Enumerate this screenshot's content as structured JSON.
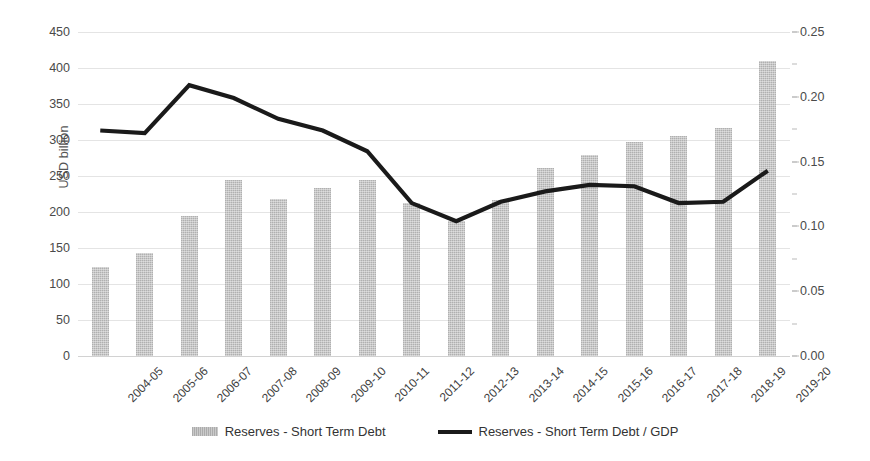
{
  "chart_data": {
    "type": "bar",
    "title": "",
    "xlabel": "",
    "ylabel": "USD billion",
    "ylabel_secondary": "",
    "grid": true,
    "legend_position": "bottom",
    "categories": [
      "2004-05",
      "2005-06",
      "2006-07",
      "2007-08",
      "2008-09",
      "2009-10",
      "2010-11",
      "2011-12",
      "2012-13",
      "2013-14",
      "2014-15",
      "2015-16",
      "2016-17",
      "2017-18",
      "2018-19",
      "2019-20"
    ],
    "axes": {
      "left": {
        "label": "USD billion",
        "min": 0,
        "max": 450,
        "step": 50,
        "ticks": [
          "0",
          "50",
          "100",
          "150",
          "200",
          "250",
          "300",
          "350",
          "400",
          "450"
        ],
        "tick_values": [
          0,
          50,
          100,
          150,
          200,
          250,
          300,
          350,
          400,
          450
        ]
      },
      "right": {
        "label": "",
        "min": 0,
        "max": 0.25,
        "step": 0.05,
        "ticks": [
          "0.00",
          "0.05",
          "0.10",
          "0.15",
          "0.20",
          "0.25"
        ],
        "tick_values": [
          0,
          0.05,
          0.1,
          0.15,
          0.2,
          0.25
        ]
      }
    },
    "series": [
      {
        "name": "Reserves - Short Term Debt",
        "type": "bar",
        "axis": "left",
        "color": "#bdbdbd",
        "values": [
          124,
          143,
          194,
          244,
          218,
          233,
          245,
          212,
          188,
          217,
          261,
          279,
          297,
          306,
          317,
          410
        ]
      },
      {
        "name": "Reserves - Short Term Debt / GDP",
        "type": "line",
        "axis": "right",
        "color": "#1a1a1a",
        "values": [
          0.174,
          0.172,
          0.209,
          0.199,
          0.183,
          0.174,
          0.158,
          0.118,
          0.104,
          0.119,
          0.127,
          0.132,
          0.131,
          0.118,
          0.119,
          0.143
        ]
      }
    ]
  },
  "legend": {
    "items": [
      {
        "label": "Reserves - Short Term Debt",
        "marker": "bar-swatch"
      },
      {
        "label": "Reserves - Short Term Debt / GDP",
        "marker": "line-swatch"
      }
    ]
  }
}
